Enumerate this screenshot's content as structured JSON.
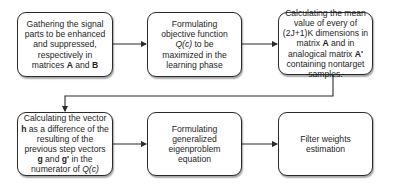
{
  "diagram": {
    "type": "flowchart",
    "row1": [
      {
        "id": "step1",
        "parts": [
          {
            "t": "Gathering the signal parts to be enhanced and suppressed, respectively in matrices "
          },
          {
            "t": "A",
            "b": true
          },
          {
            "t": " and "
          },
          {
            "t": "B",
            "b": true
          }
        ]
      },
      {
        "id": "step2",
        "parts": [
          {
            "t": "Formulating objective function "
          },
          {
            "t": "Q(c)",
            "i": true
          },
          {
            "t": " to be maximized in the learning phase"
          }
        ]
      },
      {
        "id": "step3",
        "parts": [
          {
            "t": "Calculating the mean value of every of (2J+1)K dimensions in matrix "
          },
          {
            "t": "A",
            "b": true
          },
          {
            "t": " and in analogical matrix "
          },
          {
            "t": "A'",
            "b": true
          },
          {
            "t": " containing nontarget samples."
          }
        ]
      }
    ],
    "row2": [
      {
        "id": "step4",
        "parts": [
          {
            "t": "Calculating the vector "
          },
          {
            "t": "h",
            "b": true
          },
          {
            "t": " as a difference of the resulting of the previous step vectors "
          },
          {
            "t": "g",
            "b": true
          },
          {
            "t": " and "
          },
          {
            "t": "g'",
            "b": true
          },
          {
            "t": " in the numerator of "
          },
          {
            "t": "Q(c)",
            "i": true
          }
        ]
      },
      {
        "id": "step5",
        "parts": [
          {
            "t": "Formulating generalized eigenproblem equation"
          }
        ]
      },
      {
        "id": "step6",
        "parts": [
          {
            "t": "Filter weights estimation"
          }
        ]
      }
    ],
    "edges": [
      [
        "step1",
        "step2"
      ],
      [
        "step2",
        "step3"
      ],
      [
        "step3",
        "step4"
      ],
      [
        "step4",
        "step5"
      ],
      [
        "step5",
        "step6"
      ]
    ],
    "colors": {
      "stroke": "#2b2b2b",
      "fill": "#ffffff",
      "text": "#1e1e1e"
    }
  }
}
